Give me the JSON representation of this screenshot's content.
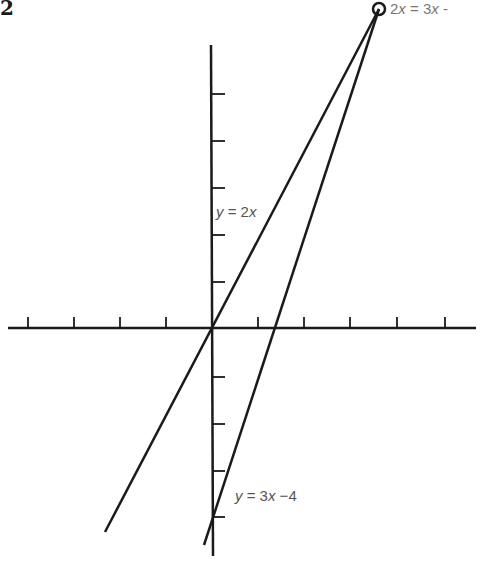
{
  "figure": {
    "number": "2"
  },
  "labels": {
    "intersection": {
      "lhs_coef": "2",
      "var": "x",
      "eq": " = ",
      "rhs_coef": "3",
      "rhs_var": "x",
      "rhs_tail": " -"
    },
    "line1": {
      "y": "y",
      "eq": " = ",
      "coef": "2",
      "var": "x"
    },
    "line2": {
      "y": "y",
      "eq": " = ",
      "coef": "3",
      "var": "x",
      "tail": " −4"
    }
  },
  "axes": {
    "origin_px": [
      211,
      328
    ],
    "x_ticks_px": [
      28,
      74,
      120,
      166,
      258,
      305,
      351,
      398,
      445
    ],
    "y_ticks_up_px": [
      94,
      141,
      188,
      235,
      282
    ],
    "y_ticks_down_px": [
      375,
      422,
      469,
      516
    ]
  },
  "lines": [
    {
      "name": "y = 2x",
      "from_px": [
        105,
        532
      ],
      "to_px": [
        379,
        9
      ]
    },
    {
      "name": "y = 3x - 4",
      "from_px": [
        204,
        545
      ],
      "to_px": [
        379,
        9
      ]
    }
  ],
  "intersection_marker": {
    "center_px": [
      379,
      9
    ],
    "radius": 6
  },
  "colors": {
    "ink": "#1a1a1a",
    "label": "#555555",
    "background": "#ffffff"
  }
}
